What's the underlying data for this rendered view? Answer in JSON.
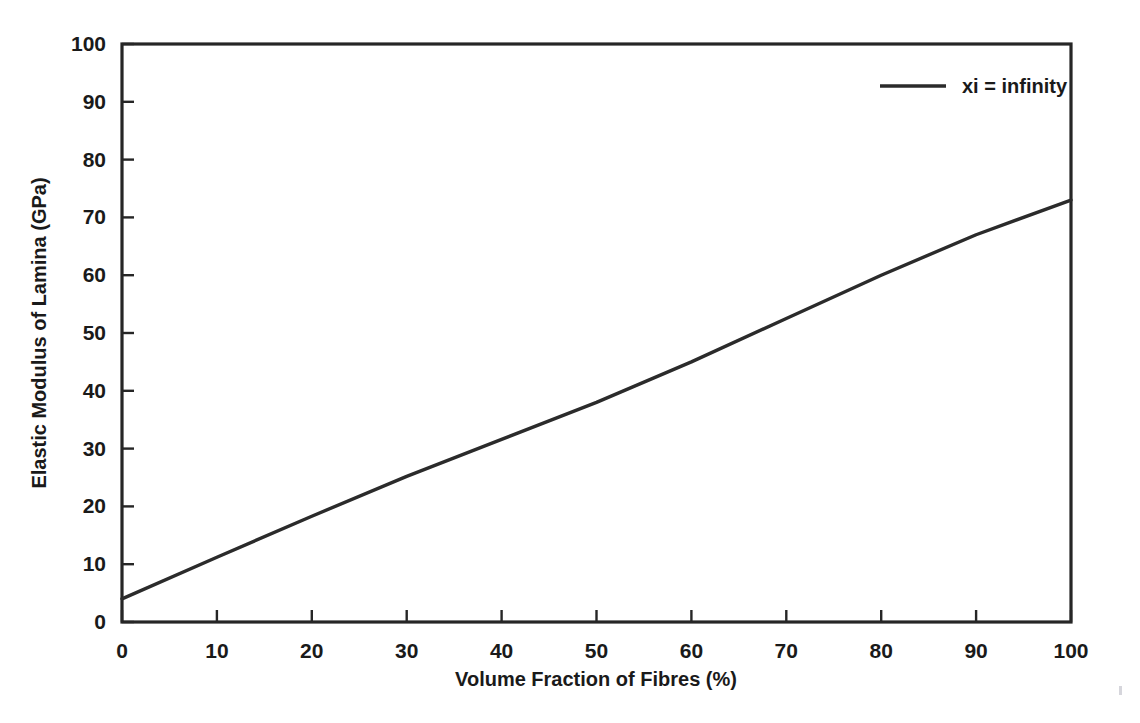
{
  "chart_data": {
    "type": "line",
    "title": "",
    "xlabel": "Volume Fraction of Fibres (%)",
    "ylabel": "Elastic Modulus of Lamina (GPa)",
    "xlim": [
      0,
      100
    ],
    "ylim": [
      0,
      100
    ],
    "xticks": [
      0,
      10,
      20,
      30,
      40,
      50,
      60,
      70,
      80,
      90,
      100
    ],
    "yticks": [
      0,
      10,
      20,
      30,
      40,
      50,
      60,
      70,
      80,
      90,
      100
    ],
    "xtick_labels": [
      "0",
      "10",
      "20",
      "30",
      "40",
      "50",
      "60",
      "70",
      "80",
      "90",
      "100"
    ],
    "ytick_labels": [
      "0",
      "10",
      "20",
      "30",
      "40",
      "50",
      "60",
      "70",
      "80",
      "90",
      "100"
    ],
    "grid": false,
    "legend_position": "top-right",
    "frame": "box",
    "tick_direction": "in",
    "line_color": "#2b2b2b",
    "series": [
      {
        "name": "xi = infinity",
        "x": [
          0,
          10,
          20,
          30,
          40,
          50,
          60,
          70,
          80,
          90,
          100
        ],
        "values": [
          4.0,
          11.2,
          18.3,
          25.2,
          31.6,
          38.0,
          45.0,
          52.5,
          60.0,
          67.0,
          73.0
        ]
      }
    ]
  },
  "legend": {
    "entries": [
      {
        "label": "xi = infinity",
        "color": "#2b2b2b"
      }
    ]
  },
  "axes": {
    "x_title": "Volume Fraction of Fibres (%)",
    "y_title": "Elastic Modulus of Lamina (GPa)"
  }
}
